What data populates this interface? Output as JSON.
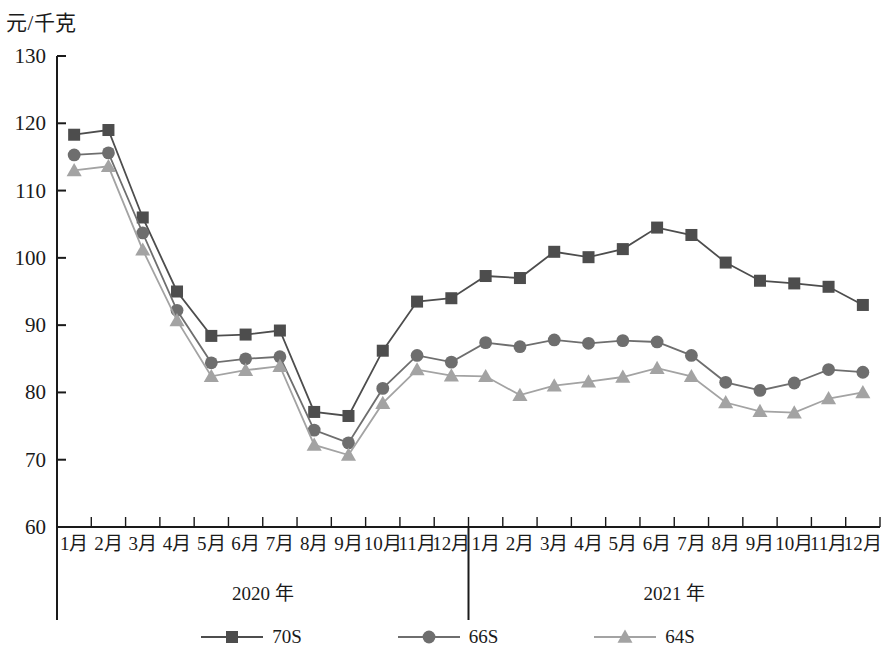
{
  "axis": {
    "y_unit_label": "元/千克",
    "y_ticks": [
      60,
      70,
      80,
      90,
      100,
      110,
      120,
      130
    ],
    "y_min": 60,
    "y_max": 130
  },
  "years": [
    {
      "label": "2020 年",
      "start_index": 0,
      "end_index": 11
    },
    {
      "label": "2021 年",
      "start_index": 12,
      "end_index": 23
    }
  ],
  "months": [
    "1月",
    "2月",
    "3月",
    "4月",
    "5月",
    "6月",
    "7月",
    "8月",
    "9月",
    "10月",
    "11月",
    "12月",
    "1月",
    "2月",
    "3月",
    "4月",
    "5月",
    "6月",
    "7月",
    "8月",
    "9月",
    "10月",
    "11月",
    "12月"
  ],
  "legend": [
    {
      "label": "70S",
      "color": "#4d4d4d",
      "marker": "square"
    },
    {
      "label": "66S",
      "color": "#6e6e6e",
      "marker": "circle"
    },
    {
      "label": "64S",
      "color": "#a3a3a3",
      "marker": "triangle"
    }
  ],
  "chart_data": {
    "type": "line",
    "title": "",
    "subtitle": "",
    "xlabel": "",
    "ylabel": "元/千克",
    "ylim": [
      60,
      130
    ],
    "ytick_step": 10,
    "grid": false,
    "legend_position": "bottom",
    "categories": [
      "1月",
      "2月",
      "3月",
      "4月",
      "5月",
      "6月",
      "7月",
      "8月",
      "9月",
      "10月",
      "11月",
      "12月",
      "1月",
      "2月",
      "3月",
      "4月",
      "5月",
      "6月",
      "7月",
      "8月",
      "9月",
      "10月",
      "11月",
      "12月"
    ],
    "group_labels": [
      "2020 年",
      "2021 年"
    ],
    "series": [
      {
        "name": "70S",
        "color": "#4d4d4d",
        "marker": "square",
        "values": [
          118.3,
          119.0,
          106.0,
          95.0,
          88.4,
          88.6,
          89.2,
          77.1,
          76.5,
          86.2,
          93.5,
          94.0,
          97.3,
          97.0,
          100.9,
          100.1,
          101.3,
          104.5,
          103.4,
          99.3,
          96.6,
          96.2,
          95.7,
          93.0
        ]
      },
      {
        "name": "66S",
        "color": "#6e6e6e",
        "marker": "circle",
        "values": [
          115.3,
          115.6,
          103.7,
          92.2,
          84.4,
          85.0,
          85.3,
          74.4,
          72.5,
          80.6,
          85.5,
          84.5,
          87.4,
          86.8,
          87.8,
          87.3,
          87.7,
          87.5,
          85.5,
          81.5,
          80.3,
          81.4,
          83.4,
          83.0
        ]
      },
      {
        "name": "64S",
        "color": "#a3a3a3",
        "marker": "triangle",
        "values": [
          113.0,
          113.6,
          101.2,
          90.7,
          82.4,
          83.3,
          83.9,
          72.2,
          70.7,
          78.4,
          83.4,
          82.5,
          82.4,
          79.6,
          81.0,
          81.6,
          82.3,
          83.6,
          82.4,
          78.5,
          77.2,
          77.0,
          79.1,
          80.0
        ]
      }
    ]
  }
}
